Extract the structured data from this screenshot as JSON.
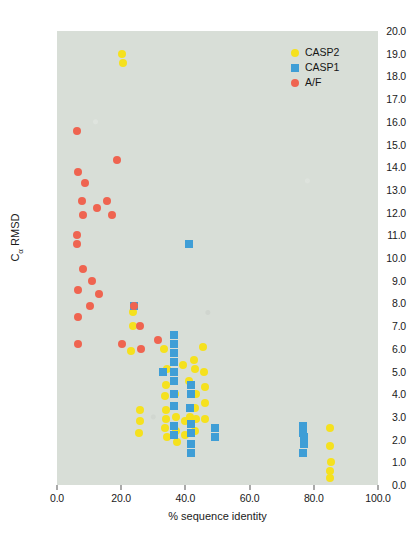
{
  "chart_data": {
    "type": "scatter",
    "title": "",
    "xlabel": "% sequence identity",
    "ylabel": "Cα RMSD",
    "xlim": [
      0.0,
      100.0
    ],
    "ylim": [
      0.0,
      20.0
    ],
    "xticks": [
      "0.0",
      "20.0",
      "40.0",
      "60.0",
      "80.0",
      "100.0"
    ],
    "xtick_values": [
      0,
      20,
      40,
      60,
      80,
      100
    ],
    "yticks": [
      "0.0",
      "1.0",
      "2.0",
      "3.0",
      "4.0",
      "5.0",
      "6.0",
      "7.0",
      "8.0",
      "9.0",
      "10.0",
      "11.0",
      "12.0",
      "13.0",
      "14.0",
      "15.0",
      "16.0",
      "17.0",
      "18.0",
      "19.0",
      "20.0"
    ],
    "ytick_values": [
      0,
      1,
      2,
      3,
      4,
      5,
      6,
      7,
      8,
      9,
      10,
      11,
      12,
      13,
      14,
      15,
      16,
      17,
      18,
      19,
      20
    ],
    "grid": false,
    "legend_position": "top-right",
    "plot_background": "#d8ded7",
    "series": [
      {
        "name": "CASP2",
        "color": "#f5e11e",
        "marker": "circle",
        "points": [
          [
            20.4,
            19.0
          ],
          [
            20.6,
            18.6
          ],
          [
            23.8,
            7.6
          ],
          [
            23.6,
            7.0
          ],
          [
            23.2,
            5.9
          ],
          [
            25.8,
            3.3
          ],
          [
            25.9,
            2.8
          ],
          [
            25.7,
            2.3
          ],
          [
            33.4,
            6.0
          ],
          [
            34.4,
            5.1
          ],
          [
            34.0,
            4.4
          ],
          [
            33.7,
            3.9
          ],
          [
            33.9,
            3.3
          ],
          [
            34.1,
            2.9
          ],
          [
            33.8,
            2.5
          ],
          [
            34.2,
            2.1
          ],
          [
            36.6,
            4.6
          ],
          [
            36.8,
            4.0
          ],
          [
            37.2,
            3.0
          ],
          [
            37.1,
            2.4
          ],
          [
            37.3,
            1.9
          ],
          [
            39.4,
            5.3
          ],
          [
            39.8,
            2.8
          ],
          [
            39.9,
            2.2
          ],
          [
            41.0,
            4.6
          ],
          [
            41.4,
            3.0
          ],
          [
            42.8,
            5.5
          ],
          [
            42.9,
            5.1
          ],
          [
            43.2,
            4.0
          ],
          [
            43.1,
            3.4
          ],
          [
            43.3,
            2.9
          ],
          [
            43.0,
            2.4
          ],
          [
            45.6,
            6.1
          ],
          [
            45.8,
            5.0
          ],
          [
            46.0,
            4.3
          ],
          [
            46.2,
            3.6
          ],
          [
            46.1,
            2.9
          ],
          [
            85.2,
            2.5
          ],
          [
            85.0,
            1.7
          ],
          [
            85.3,
            1.0
          ],
          [
            85.1,
            0.6
          ],
          [
            85.2,
            0.3
          ]
        ]
      },
      {
        "name": "CASP1",
        "color": "#3f9ed6",
        "marker": "square",
        "points": [
          [
            41.0,
            10.6
          ],
          [
            33.0,
            5.0
          ],
          [
            36.4,
            6.6
          ],
          [
            36.4,
            6.2
          ],
          [
            36.4,
            5.8
          ],
          [
            36.4,
            5.4
          ],
          [
            36.4,
            5.0
          ],
          [
            36.4,
            4.6
          ],
          [
            36.5,
            4.0
          ],
          [
            36.5,
            3.5
          ],
          [
            36.3,
            2.6
          ],
          [
            36.3,
            2.2
          ],
          [
            41.6,
            4.4
          ],
          [
            41.6,
            4.0
          ],
          [
            41.5,
            3.4
          ],
          [
            41.7,
            2.7
          ],
          [
            41.7,
            2.3
          ],
          [
            41.8,
            1.8
          ],
          [
            41.8,
            1.4
          ],
          [
            24.0,
            7.9
          ],
          [
            49.2,
            2.5
          ],
          [
            49.2,
            2.1
          ],
          [
            76.6,
            2.6
          ],
          [
            76.6,
            2.3
          ],
          [
            77.0,
            2.1
          ],
          [
            76.8,
            1.8
          ],
          [
            76.7,
            1.4
          ]
        ]
      },
      {
        "name": "A/F",
        "color": "#ef6450",
        "marker": "circle",
        "points": [
          [
            6.2,
            15.6
          ],
          [
            6.4,
            13.8
          ],
          [
            8.6,
            13.3
          ],
          [
            18.6,
            14.3
          ],
          [
            7.8,
            12.5
          ],
          [
            8.0,
            11.9
          ],
          [
            12.6,
            12.2
          ],
          [
            15.6,
            12.5
          ],
          [
            17.2,
            11.9
          ],
          [
            6.3,
            11.0
          ],
          [
            6.3,
            10.6
          ],
          [
            8.0,
            9.5
          ],
          [
            11.0,
            9.0
          ],
          [
            6.5,
            8.6
          ],
          [
            13.2,
            8.4
          ],
          [
            10.4,
            7.9
          ],
          [
            6.6,
            7.4
          ],
          [
            24.0,
            7.9
          ],
          [
            20.4,
            6.2
          ],
          [
            6.5,
            6.2
          ],
          [
            26.0,
            7.0
          ],
          [
            26.2,
            6.0
          ],
          [
            31.6,
            6.4
          ]
        ]
      }
    ]
  },
  "legend": {
    "entries": [
      {
        "label": "CASP2",
        "color": "#f5e11e",
        "marker": "circle"
      },
      {
        "label": "CASP1",
        "color": "#3f9ed6",
        "marker": "square"
      },
      {
        "label": "A/F",
        "color": "#ef6450",
        "marker": "circle"
      }
    ]
  },
  "footer": {
    "text": ""
  }
}
